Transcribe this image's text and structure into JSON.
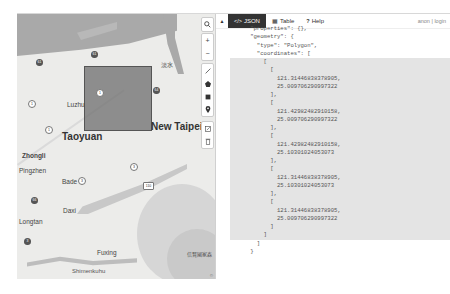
{
  "map": {
    "labels": {
      "city_taoyuan": "Taoyuan",
      "city_new_taipei": "New Taipei",
      "luzhu": "Luzhu",
      "zhongli": "Zhongli",
      "pingzhen": "Pingzhen",
      "bade": "Bade",
      "daxi": "Daxi",
      "longtan": "Longtan",
      "fuxing": "Fuxing",
      "shenkeng": "Shimenkuhu",
      "bottom_right": "信賢國家森",
      "tamsui": "淡水",
      "road_110": "110",
      "road_1": "1",
      "road_3": "3"
    },
    "controls": {
      "search": "search-icon",
      "zoom_in": "+",
      "zoom_out": "−",
      "draw_line": "line-icon",
      "draw_polygon": "polygon-icon",
      "draw_rectangle": "rectangle-icon",
      "draw_marker": "marker-icon",
      "edit": "edit-icon",
      "delete": "trash-icon"
    },
    "attribution": "©"
  },
  "editor": {
    "collapse_label": "▲",
    "tabs": [
      {
        "icon": "</>",
        "label": "JSON",
        "active": true
      },
      {
        "icon": "▦",
        "label": "Table",
        "active": false
      },
      {
        "icon": "?",
        "label": "Help",
        "active": false
      }
    ],
    "user_links": "anon | login",
    "lines": [
      {
        "n": "6",
        "text": "      \"properties\": {},",
        "hl": false
      },
      {
        "n": "7",
        "text": "      \"geometry\": {",
        "hl": false
      },
      {
        "n": "8",
        "text": "        \"type\": \"Polygon\",",
        "hl": false
      },
      {
        "n": "9",
        "text": "        \"coordinates\": [",
        "hl": false
      },
      {
        "n": "10",
        "text": "          [",
        "hl": true
      },
      {
        "n": "11",
        "text": "            [",
        "hl": true
      },
      {
        "n": "12",
        "text": "              121.31446838378905,",
        "hl": true
      },
      {
        "n": "13",
        "text": "              25.009706290997322",
        "hl": true
      },
      {
        "n": "14",
        "text": "            ],",
        "hl": true
      },
      {
        "n": "15",
        "text": "            [",
        "hl": true
      },
      {
        "n": "16",
        "text": "              121.42982482910158,",
        "hl": true
      },
      {
        "n": "17",
        "text": "              25.009706290997322",
        "hl": true
      },
      {
        "n": "18",
        "text": "            ],",
        "hl": true
      },
      {
        "n": "19",
        "text": "            [",
        "hl": true
      },
      {
        "n": "20",
        "text": "              121.42982482910158,",
        "hl": true
      },
      {
        "n": "21",
        "text": "              25.10301024053073",
        "hl": true
      },
      {
        "n": "22",
        "text": "            ],",
        "hl": true
      },
      {
        "n": "23",
        "text": "            [",
        "hl": true
      },
      {
        "n": "24",
        "text": "              121.31446838378905,",
        "hl": true
      },
      {
        "n": "25",
        "text": "              25.10301024053073",
        "hl": true
      },
      {
        "n": "26",
        "text": "            ],",
        "hl": true
      },
      {
        "n": "27",
        "text": "            [",
        "hl": true
      },
      {
        "n": "28",
        "text": "              121.31446838378905,",
        "hl": true
      },
      {
        "n": "29",
        "text": "              25.009706290997322",
        "hl": true
      },
      {
        "n": "30",
        "text": "            ]",
        "hl": true
      },
      {
        "n": "31",
        "text": "          ]",
        "hl": true
      },
      {
        "n": "32",
        "text": "        ]",
        "hl": false
      },
      {
        "n": "33",
        "text": "      }",
        "hl": false
      }
    ]
  }
}
